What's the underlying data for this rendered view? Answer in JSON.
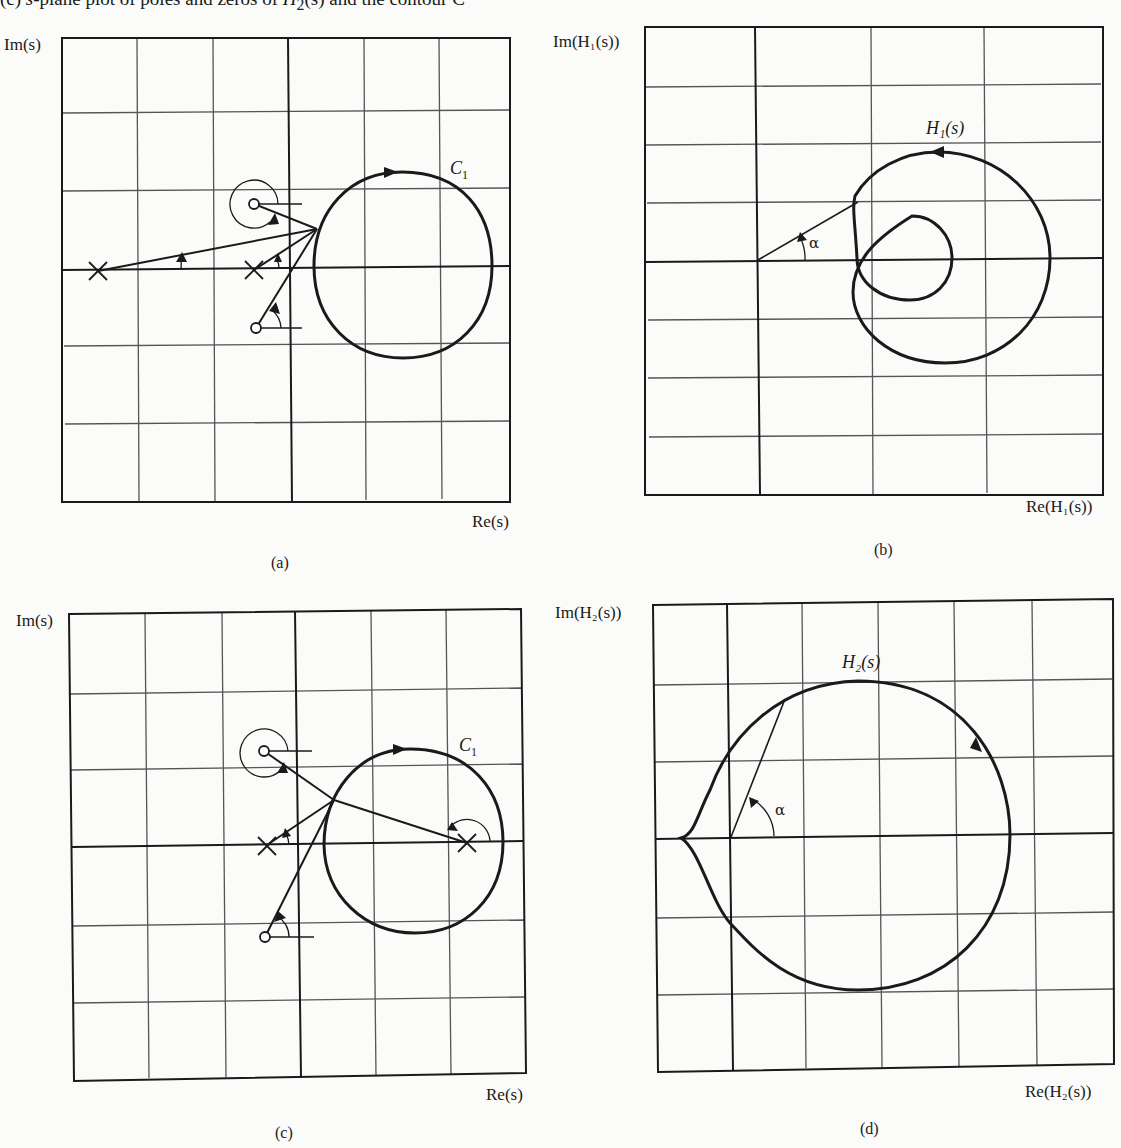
{
  "caption": {
    "text_prefix": "(c) ",
    "s_var": "s",
    "text_mid": "-plane plot of poles and zeros of ",
    "h2": "H",
    "h2_sub": "2",
    "text_mid2": "(s) and the contour C",
    "text_tail": "₁, (d) H₂(s) for s on C₁"
  },
  "panels": {
    "a": {
      "label": "(a)",
      "y_axis_label": "Im(s)",
      "x_axis_label": "Re(s)",
      "contour_label": "C",
      "contour_sub": "1"
    },
    "b": {
      "label": "(b)",
      "y_axis_label": "Im(H₁(s))",
      "x_axis_label": "Re(H₁(s))",
      "curve_label": "H₁(s)",
      "angle_label": "α"
    },
    "c": {
      "label": "(c)",
      "y_axis_label": "Im(s)",
      "x_axis_label": "Re(s)",
      "contour_label": "C",
      "contour_sub": "1"
    },
    "d": {
      "label": "(d)",
      "y_axis_label": "Im(H₂(s))",
      "x_axis_label": "Re(H₂(s))",
      "curve_label": "H₂(s)",
      "angle_label": "α"
    }
  },
  "colors": {
    "ink": "#1a1a1a",
    "grid": "#555555",
    "paper": "#fbfbf9"
  }
}
